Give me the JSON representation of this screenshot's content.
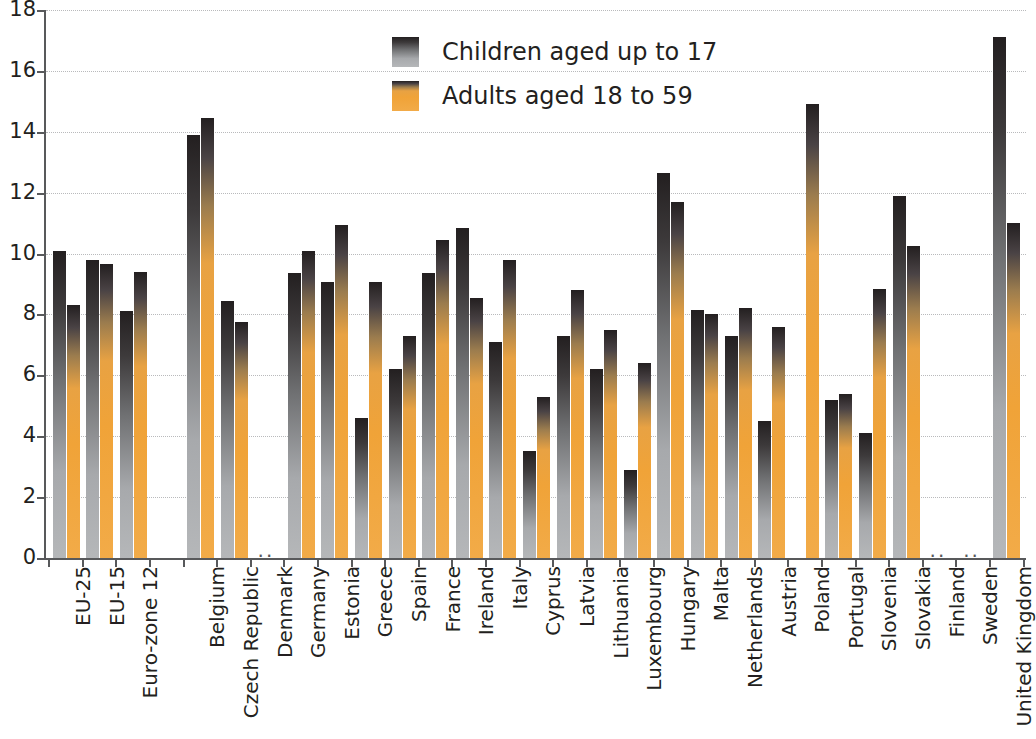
{
  "chart_data": {
    "type": "bar",
    "title": "",
    "subtitle": "",
    "xlabel": "",
    "ylabel": "",
    "ylim": [
      0,
      18
    ],
    "ytick_labels": [
      "0",
      "2",
      "4",
      "6",
      "8",
      "10",
      "12",
      "14",
      "16",
      "18"
    ],
    "yticks": [
      0,
      2,
      4,
      6,
      8,
      10,
      12,
      14,
      16,
      18
    ],
    "grid": true,
    "legend_position": "top-center",
    "no_data_marker": "..",
    "series": [
      {
        "name": "Children aged up to 17",
        "color": "#8e9093",
        "values": [
          10.1,
          9.8,
          8.1,
          null,
          13.9,
          8.45,
          null,
          9.35,
          9.05,
          4.6,
          6.2,
          9.35,
          10.85,
          7.1,
          3.5,
          7.3,
          6.2,
          2.9,
          12.65,
          8.15,
          7.3,
          4.5,
          null,
          5.2,
          4.1,
          11.9,
          null,
          null,
          17.1
        ]
      },
      {
        "name": "Adults aged 18 to 59",
        "color": "#f0a338",
        "values": [
          8.3,
          9.65,
          9.4,
          null,
          14.45,
          7.75,
          null,
          10.1,
          10.95,
          9.05,
          7.3,
          10.45,
          8.55,
          9.8,
          5.3,
          8.8,
          7.5,
          6.4,
          11.7,
          8.0,
          8.2,
          7.6,
          14.9,
          5.4,
          8.85,
          10.25,
          null,
          null,
          11.0
        ]
      }
    ],
    "categories": [
      "EU-25",
      "EU-15",
      "Euro-zone 12",
      "",
      "Belgium",
      "Czech Republic",
      "Denmark",
      "Germany",
      "Estonia",
      "Greece",
      "Spain",
      "France",
      "Ireland",
      "Italy",
      "Cyprus",
      "Latvia",
      "Lithuania",
      "Luxembourg",
      "Hungary",
      "Malta",
      "Netherlands",
      "Austria",
      "Poland",
      "Portugal",
      "Slovenia",
      "Slovakia",
      "Finland",
      "Sweden",
      "United Kingdom"
    ]
  },
  "legend": {
    "items": [
      {
        "label": "Children aged up to 17",
        "color": "#8e9093"
      },
      {
        "label": "Adults aged 18 to 59",
        "color": "#f0a338"
      }
    ]
  },
  "colors": {
    "children": "#8e9093",
    "adults": "#f0a338",
    "axis": "#58595b",
    "grid": "#b9babc",
    "text": "#231f20"
  }
}
